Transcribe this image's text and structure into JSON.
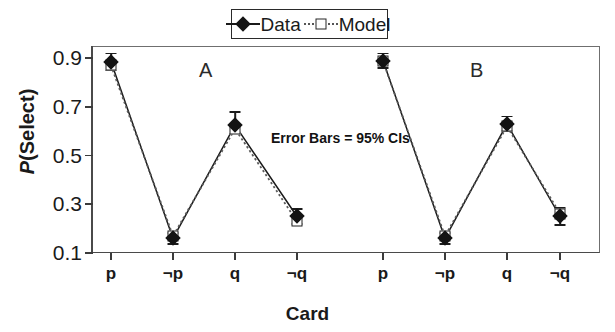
{
  "figure": {
    "legend": {
      "entries": [
        {
          "label": "Data",
          "marker": "filled-diamond",
          "line": "solid",
          "color": "#131313"
        },
        {
          "label": "Model",
          "marker": "open-square",
          "line": "dotted",
          "color": "#555555"
        }
      ]
    },
    "annotation": "Error Bars = 95% CIs",
    "panel_labels": [
      "A",
      "B"
    ]
  },
  "chart_data": {
    "type": "line",
    "title": "",
    "subtitle": "",
    "xlabel": "Card",
    "ylabel": "P(Select)",
    "ylim": [
      0.1,
      0.95
    ],
    "yticks": [
      0.9,
      0.7,
      0.5,
      0.3,
      0.1
    ],
    "ytick_labels": [
      "0.9",
      "0.7",
      "0.5",
      "0.3",
      "0.1"
    ],
    "grid": false,
    "legend_position": "top-center",
    "annotations": [
      {
        "text": "Error Bars = 95% CIs",
        "x": 4.35,
        "y": 0.545
      },
      {
        "text": "A",
        "x": 1.55,
        "y": 0.875
      },
      {
        "text": "B",
        "x": 5.55,
        "y": 0.875
      }
    ],
    "panels": [
      "A",
      "B"
    ],
    "categories": [
      "p",
      "¬p",
      "q",
      "¬q",
      "p",
      "¬p",
      "q",
      "¬q"
    ],
    "xtick_labels": [
      "p",
      "¬p",
      "q",
      "¬q",
      "p",
      "¬p",
      "q",
      "¬q"
    ],
    "series": [
      {
        "name": "Data",
        "marker": "filled-diamond",
        "linestyle": "solid",
        "values": [
          0.885,
          0.16,
          0.625,
          0.25,
          0.89,
          0.16,
          0.63,
          0.25
        ],
        "err_low": [
          0.035,
          0.022,
          0.035,
          0.03,
          0.03,
          0.022,
          0.03,
          0.035
        ],
        "err_high": [
          0.035,
          0.022,
          0.055,
          0.03,
          0.03,
          0.022,
          0.03,
          0.035
        ]
      },
      {
        "name": "Model",
        "marker": "open-square",
        "linestyle": "dotted",
        "values": [
          0.87,
          0.17,
          0.61,
          0.23,
          0.888,
          0.17,
          0.62,
          0.262
        ],
        "err_low": [
          0.0,
          0.0,
          0.0,
          0.0,
          0.0,
          0.0,
          0.0,
          0.0
        ],
        "err_high": [
          0.0,
          0.0,
          0.0,
          0.0,
          0.0,
          0.0,
          0.0,
          0.0
        ]
      }
    ]
  },
  "geometry": {
    "plot_left": 92,
    "plot_right": 600,
    "plot_top": 46,
    "plot_bottom": 253,
    "x_positions": [
      111,
      173,
      235,
      297,
      383,
      445,
      507,
      560
    ],
    "y_value_top": 0.95,
    "y_value_bottom": 0.1
  }
}
